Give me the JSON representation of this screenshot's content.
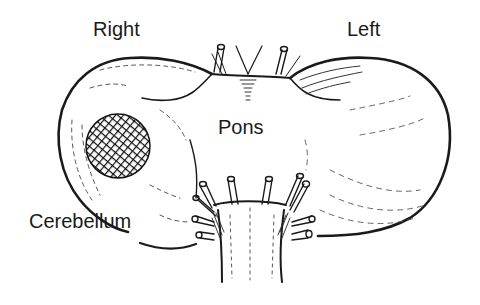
{
  "diagram": {
    "labels": {
      "right": "Right",
      "left": "Left",
      "pons": "Pons",
      "cerebellum": "Cerebellum"
    },
    "regions": [
      {
        "name": "right-cerebellar-hemisphere",
        "side": "Right"
      },
      {
        "name": "left-cerebellar-hemisphere",
        "side": "Left"
      },
      {
        "name": "pons"
      },
      {
        "name": "medulla-brainstem"
      },
      {
        "name": "lesion",
        "location": "right cerebellar hemisphere",
        "style": "cross-hatched"
      }
    ],
    "colors": {
      "ink": "#1a1a1a",
      "background": "#ffffff"
    }
  }
}
